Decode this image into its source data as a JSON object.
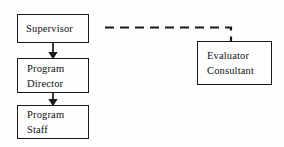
{
  "diagram": {
    "type": "organizational-flowchart",
    "background_color": "#fefefe",
    "stroke_color": "#1a1a1a",
    "text_color": "#111111",
    "nodes": [
      {
        "id": "supervisor",
        "label": "Supervisor",
        "lines": [
          "Supervisor"
        ]
      },
      {
        "id": "program-director",
        "label": "Program Director",
        "lines": [
          "Program",
          "Director"
        ]
      },
      {
        "id": "program-staff",
        "label": "Program Staff",
        "lines": [
          "Program",
          "Staff"
        ]
      },
      {
        "id": "evaluator-consultant",
        "label": "Evaluator Consultant",
        "lines": [
          "Evaluator",
          "Consultant"
        ]
      }
    ],
    "connectors": [
      {
        "id": "supervisor-to-program-director",
        "from": "supervisor",
        "to": "program-director",
        "style": "solid",
        "arrow": "down"
      },
      {
        "id": "program-director-to-program-staff",
        "from": "program-director",
        "to": "program-staff",
        "style": "solid",
        "arrow": "down"
      },
      {
        "id": "supervisor-to-evaluator-consultant",
        "from": "supervisor",
        "to": "evaluator-consultant",
        "style": "dashed",
        "arrow": "none"
      }
    ]
  }
}
